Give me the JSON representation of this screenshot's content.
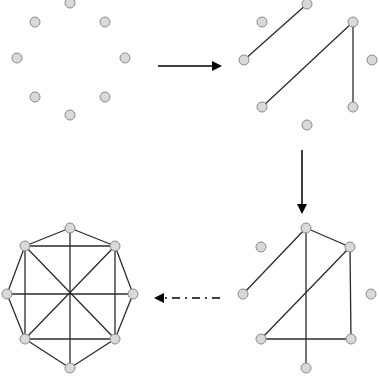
{
  "diagram": {
    "node_style": {
      "fill": "#d9d9d9",
      "stroke": "#8a8a8a",
      "radius": 5
    },
    "edge_color": "#2b2b2b",
    "panels": [
      {
        "id": "top-left",
        "nodes": [
          [
            70,
            3
          ],
          [
            35,
            22
          ],
          [
            105,
            22
          ],
          [
            17,
            58
          ],
          [
            125,
            58
          ],
          [
            35,
            97
          ],
          [
            105,
            97
          ],
          [
            70,
            115
          ]
        ],
        "edges": []
      },
      {
        "id": "top-right",
        "nodes": [
          [
            307,
            4
          ],
          [
            262,
            22
          ],
          [
            353,
            22
          ],
          [
            244,
            60
          ],
          [
            372,
            60
          ],
          [
            262,
            107
          ],
          [
            353,
            107
          ],
          [
            307,
            125
          ]
        ],
        "edges": [
          [
            0,
            3
          ],
          [
            2,
            5
          ],
          [
            2,
            6
          ]
        ]
      },
      {
        "id": "bottom-right",
        "nodes": [
          [
            306,
            228
          ],
          [
            261,
            247
          ],
          [
            350,
            247
          ],
          [
            243,
            294
          ],
          [
            371,
            294
          ],
          [
            261,
            339
          ],
          [
            351,
            339
          ],
          [
            306,
            368
          ]
        ],
        "edges": [
          [
            0,
            3
          ],
          [
            0,
            7
          ],
          [
            0,
            2
          ],
          [
            2,
            5
          ],
          [
            2,
            6
          ],
          [
            5,
            6
          ]
        ]
      },
      {
        "id": "bottom-left",
        "nodes": [
          [
            70,
            228
          ],
          [
            25,
            246
          ],
          [
            115,
            246
          ],
          [
            7,
            294
          ],
          [
            133,
            294
          ],
          [
            25,
            339
          ],
          [
            115,
            339
          ],
          [
            70,
            368
          ]
        ],
        "edges": [
          [
            0,
            1
          ],
          [
            0,
            2
          ],
          [
            1,
            3
          ],
          [
            2,
            4
          ],
          [
            3,
            5
          ],
          [
            4,
            6
          ],
          [
            5,
            7
          ],
          [
            6,
            7
          ],
          [
            1,
            2
          ],
          [
            1,
            5
          ],
          [
            2,
            6
          ],
          [
            5,
            6
          ],
          [
            0,
            7
          ],
          [
            3,
            4
          ],
          [
            1,
            6
          ],
          [
            2,
            5
          ]
        ]
      }
    ],
    "arrows": [
      {
        "id": "arrow-right",
        "from": [
          158,
          66
        ],
        "to": [
          220,
          66
        ],
        "style": "solid"
      },
      {
        "id": "arrow-down",
        "from": [
          302,
          150
        ],
        "to": [
          302,
          212
        ],
        "style": "solid"
      },
      {
        "id": "arrow-left",
        "from": [
          220,
          298
        ],
        "to": [
          156,
          298
        ],
        "style": "dash-dot"
      }
    ]
  }
}
